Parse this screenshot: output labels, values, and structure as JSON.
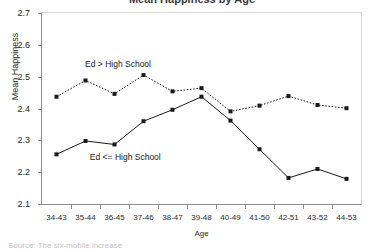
{
  "figure": {
    "title_cutoff": "Mean Happiness by Age",
    "footer_cutoff": "Source:  The six-mobile increase",
    "background": "#ffffff",
    "frame_color": "#8c8c8c",
    "frame_light_color": "#d9d9d9"
  },
  "annotations": [
    {
      "text": "Ed > High School",
      "x_pct": 13.5,
      "y_pct": 24.5
    },
    {
      "text": "Ed <= High School",
      "x_pct": 15.0,
      "y_pct": 73.5
    }
  ],
  "chart_data": {
    "type": "line",
    "title": "Mean Happiness by Age",
    "xlabel": "Age",
    "ylabel": "Mean Happiness",
    "ylim": [
      2.1,
      2.7
    ],
    "yticks": [
      2.1,
      2.2,
      2.3,
      2.4,
      2.5,
      2.6,
      2.7
    ],
    "ytick_labels": [
      "2.1",
      "2.2",
      "2.3",
      "2.4",
      "2.5",
      "2.6",
      "2.7"
    ],
    "grid": false,
    "legend_position": "in-plot-annotation",
    "categories": [
      "34-43",
      "35-44",
      "36-45",
      "37-46",
      "38-47",
      "39-48",
      "40-49",
      "41-50",
      "42-51",
      "43-52",
      "44-53"
    ],
    "series": [
      {
        "name": "Ed > High School",
        "style": "dotted",
        "color": "#1a1a1a",
        "marker": "square",
        "values": [
          2.437,
          2.488,
          2.446,
          2.505,
          2.454,
          2.464,
          2.391,
          2.409,
          2.439,
          2.411,
          2.401
        ]
      },
      {
        "name": "Ed <= High School",
        "style": "solid",
        "color": "#1a1a1a",
        "marker": "square",
        "values": [
          2.256,
          2.298,
          2.287,
          2.36,
          2.396,
          2.437,
          2.362,
          2.272,
          2.182,
          2.21,
          2.179
        ]
      }
    ]
  }
}
